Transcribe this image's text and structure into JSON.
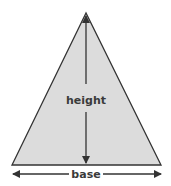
{
  "diagram": {
    "shape": "isosceles-triangle",
    "fill_color": "#dcdcdc",
    "stroke_color": "#333333",
    "labels": {
      "height": "height",
      "base": "base"
    }
  }
}
